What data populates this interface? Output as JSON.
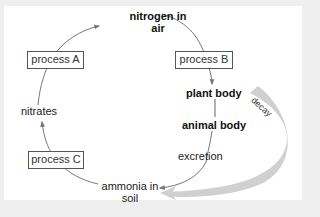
{
  "diagram": {
    "colors": {
      "background": "#efefef",
      "panel": "#ffffff",
      "arrow": "#777777",
      "decay_band": "#cfcfcf",
      "box_border": "#555555",
      "text": "#222222"
    },
    "nodes": {
      "nitrogen_in_air": {
        "line1": "nitrogen in",
        "line2": "air",
        "bold": true
      },
      "plant_body": {
        "label": "plant body",
        "bold": true
      },
      "animal_body": {
        "label": "animal body",
        "bold": true
      },
      "excretion": {
        "label": "excretion",
        "bold": false
      },
      "ammonia_in_soil": {
        "line1": "ammonia in",
        "line2": "soil",
        "bold": false
      },
      "nitrates": {
        "label": "nitrates",
        "bold": false
      }
    },
    "process_boxes": {
      "process_a": "process A",
      "process_b": "process B",
      "process_c": "process C"
    },
    "decay_label": "decay",
    "edges": [
      {
        "from": "nitrates",
        "to": "nitrogen in air",
        "via": "process A"
      },
      {
        "from": "nitrogen in air",
        "to": "plant body",
        "via": "process B"
      },
      {
        "from": "plant body",
        "to": "animal body"
      },
      {
        "from": "animal body",
        "to": "ammonia in soil",
        "via": "excretion"
      },
      {
        "from": "plant body / animal body",
        "to": "ammonia in soil",
        "via": "decay"
      },
      {
        "from": "ammonia in soil",
        "to": "nitrates",
        "via": "process C"
      }
    ]
  }
}
